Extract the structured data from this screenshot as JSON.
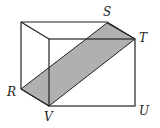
{
  "diagram": {
    "type": "rectangular-prism",
    "shaded_region": [
      "R",
      "S",
      "T",
      "V"
    ],
    "shade_color": "#b0b0b0",
    "line_color": "#222222",
    "labels": {
      "R": "R",
      "S": "S",
      "T": "T",
      "U": "U",
      "V": "V"
    }
  }
}
